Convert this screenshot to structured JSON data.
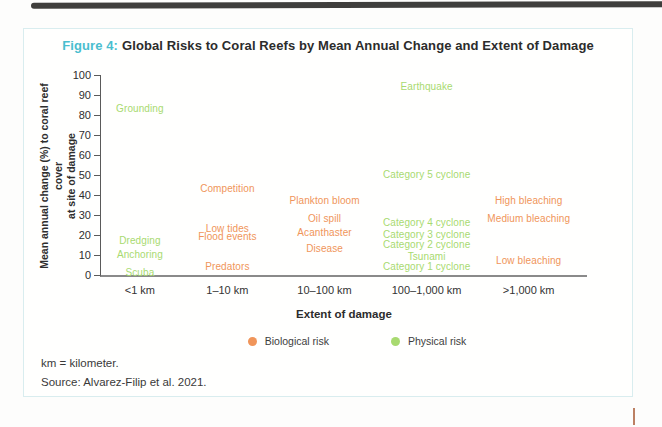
{
  "title": {
    "prefix": "Figure 4:",
    "text": "Global Risks to Coral Reefs by Mean Annual Change and Extent of Damage"
  },
  "colors": {
    "accent_teal": "#49becf",
    "biological": "#f0955a",
    "physical": "#a8da70",
    "axis": "#5a5a5a"
  },
  "footer": {
    "footnote": "km = kilometer.",
    "source": "Source: Alvarez-Filip et al. 2021."
  },
  "chart_data": {
    "type": "scatter",
    "title": "Global Risks to Coral Reefs by Mean Annual Change and Extent of Damage",
    "xlabel": "Extent of damage",
    "ylabel": "Mean annual change (%) to coral reef cover at site of damage",
    "ylabel_line1": "Mean annual change (%) to coral reef cover",
    "ylabel_line2": "at site of damage",
    "ylim": [
      0,
      100
    ],
    "ytick_step": 10,
    "grid": false,
    "legend_position": "bottom",
    "categories": [
      "<1 km",
      "1–10 km",
      "10–100 km",
      "100–1,000 km",
      ">1,000 km"
    ],
    "category_x_percent": [
      8,
      26,
      46,
      67,
      88
    ],
    "legend": [
      {
        "label": "Biological risk",
        "type": "biological",
        "color": "#f0955a"
      },
      {
        "label": "Physical risk",
        "type": "physical",
        "color": "#a8da70"
      }
    ],
    "points": [
      {
        "label": "Grounding",
        "category": "<1 km",
        "cat_index": 0,
        "value": 83,
        "type": "physical"
      },
      {
        "label": "Dredging",
        "category": "<1 km",
        "cat_index": 0,
        "value": 17,
        "type": "physical"
      },
      {
        "label": "Anchoring",
        "category": "<1 km",
        "cat_index": 0,
        "value": 10,
        "type": "physical"
      },
      {
        "label": "Scuba",
        "category": "<1 km",
        "cat_index": 0,
        "value": 1,
        "type": "physical"
      },
      {
        "label": "Competition",
        "category": "1–10 km",
        "cat_index": 1,
        "value": 43,
        "type": "biological"
      },
      {
        "label": "Low tides",
        "category": "1–10 km",
        "cat_index": 1,
        "value": 23,
        "type": "biological"
      },
      {
        "label": "Flood events",
        "category": "1–10 km",
        "cat_index": 1,
        "value": 19,
        "type": "biological"
      },
      {
        "label": "Predators",
        "category": "1–10 km",
        "cat_index": 1,
        "value": 4,
        "type": "biological"
      },
      {
        "label": "Plankton bloom",
        "category": "10–100 km",
        "cat_index": 2,
        "value": 37,
        "type": "biological"
      },
      {
        "label": "Oil spill",
        "category": "10–100 km",
        "cat_index": 2,
        "value": 28,
        "type": "biological"
      },
      {
        "label": "Acanthaster",
        "category": "10–100 km",
        "cat_index": 2,
        "value": 21,
        "type": "biological"
      },
      {
        "label": "Disease",
        "category": "10–100 km",
        "cat_index": 2,
        "value": 13,
        "type": "biological"
      },
      {
        "label": "Earthquake",
        "category": "100–1,000 km",
        "cat_index": 3,
        "value": 94,
        "type": "physical"
      },
      {
        "label": "Category 5 cyclone",
        "category": "100–1,000 km",
        "cat_index": 3,
        "value": 50,
        "type": "physical"
      },
      {
        "label": "Category 4 cyclone",
        "category": "100–1,000 km",
        "cat_index": 3,
        "value": 26,
        "type": "physical"
      },
      {
        "label": "Category 3 cyclone",
        "category": "100–1,000 km",
        "cat_index": 3,
        "value": 20,
        "type": "physical"
      },
      {
        "label": "Category 2 cyclone",
        "category": "100–1,000 km",
        "cat_index": 3,
        "value": 15,
        "type": "physical"
      },
      {
        "label": "Tsunami",
        "category": "100–1,000 km",
        "cat_index": 3,
        "value": 9,
        "type": "physical"
      },
      {
        "label": "Category 1 cyclone",
        "category": "100–1,000 km",
        "cat_index": 3,
        "value": 4,
        "type": "physical"
      },
      {
        "label": "High bleaching",
        "category": ">1,000 km",
        "cat_index": 4,
        "value": 37,
        "type": "biological"
      },
      {
        "label": "Medium bleaching",
        "category": ">1,000 km",
        "cat_index": 4,
        "value": 28,
        "type": "biological"
      },
      {
        "label": "Low bleaching",
        "category": ">1,000 km",
        "cat_index": 4,
        "value": 7,
        "type": "biological"
      }
    ]
  }
}
